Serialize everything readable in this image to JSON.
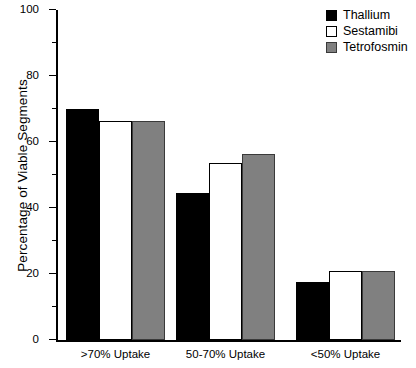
{
  "chart_data": {
    "type": "bar",
    "title": "",
    "xlabel": "",
    "ylabel": "Percentage of Viable Segments",
    "ylim": [
      0,
      100
    ],
    "yticks": [
      0,
      20,
      40,
      60,
      80,
      100
    ],
    "yticks_minor": [
      10,
      30,
      50,
      70,
      90
    ],
    "grid": false,
    "legend_position": "top-right",
    "categories": [
      ">70% Uptake",
      "50-70% Uptake",
      "<50% Uptake"
    ],
    "series": [
      {
        "name": "Thallium",
        "color": "#000000",
        "values": [
          70.0,
          44.5,
          17.5
        ]
      },
      {
        "name": "Sestamibi",
        "color": "#ffffff",
        "values": [
          66.5,
          53.5,
          21.0
        ]
      },
      {
        "name": "Tetrofosmin",
        "color": "#808080",
        "values": [
          66.5,
          56.5,
          21.0
        ]
      }
    ]
  },
  "axis": {
    "y_title": "Percentage of Viable Segments",
    "tick_labels": [
      "0",
      "20",
      "40",
      "60",
      "80",
      "100"
    ]
  },
  "legend": {
    "entries": [
      {
        "label": "Thallium"
      },
      {
        "label": "Sestamibi"
      },
      {
        "label": "Tetrofosmin"
      }
    ]
  }
}
